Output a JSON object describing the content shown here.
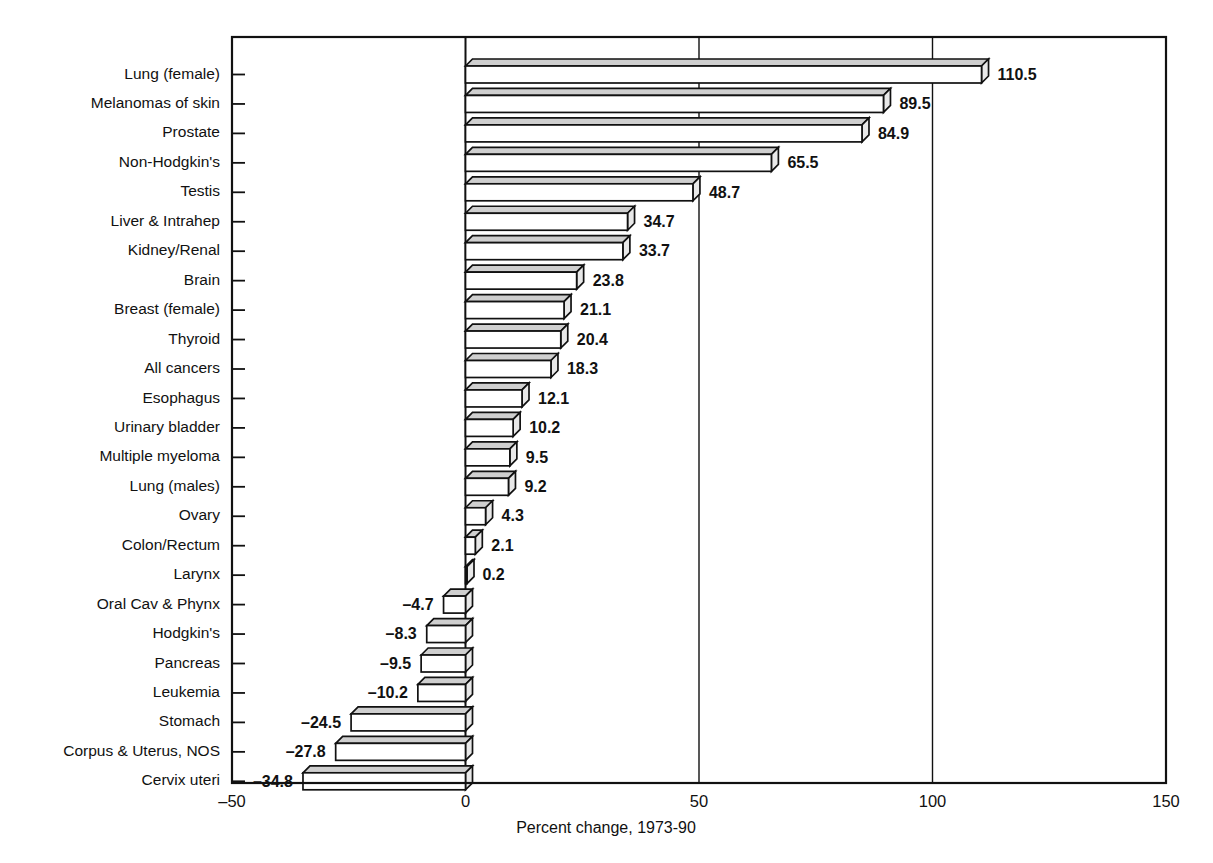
{
  "chart_data": {
    "type": "bar",
    "orientation": "horizontal",
    "title": "",
    "xlabel": "Percent change, 1973-90",
    "ylabel": "",
    "xlim": [
      -50,
      150
    ],
    "xticks": [
      -50,
      0,
      50,
      100,
      150
    ],
    "xtick_labels": [
      "–50",
      "0",
      "50",
      "100",
      "150"
    ],
    "grid": "vertical gridlines at 50 and 100; zero reference line at 0",
    "legend": "none",
    "categories": [
      "Lung (female)",
      "Melanomas of skin",
      "Prostate",
      "Non-Hodgkin's",
      "Testis",
      "Liver & Intrahep",
      "Kidney/Renal",
      "Brain",
      "Breast (female)",
      "Thyroid",
      "All cancers",
      "Esophagus",
      "Urinary bladder",
      "Multiple myeloma",
      "Lung (males)",
      "Ovary",
      "Colon/Rectum",
      "Larynx",
      "Oral Cav & Phynx",
      "Hodgkin's",
      "Pancreas",
      "Leukemia",
      "Stomach",
      "Corpus & Uterus, NOS",
      "Cervix uteri"
    ],
    "values": [
      110.5,
      89.5,
      84.9,
      65.5,
      48.7,
      34.7,
      33.7,
      23.8,
      21.1,
      20.4,
      18.3,
      12.1,
      10.2,
      9.5,
      9.2,
      4.3,
      2.1,
      0.2,
      -4.7,
      -8.3,
      -9.5,
      -10.2,
      -24.5,
      -27.8,
      -34.8
    ],
    "value_labels": [
      "110.5",
      "89.5",
      "84.9",
      "65.5",
      "48.7",
      "34.7",
      "33.7",
      "23.8",
      "21.1",
      "20.4",
      "18.3",
      "12.1",
      "10.2",
      "9.5",
      "9.2",
      "4.3",
      "2.1",
      "0.2",
      "–4.7",
      "–8.3",
      "–9.5",
      "–10.2",
      "–24.5",
      "–27.8",
      "–34.8"
    ]
  },
  "colors": {
    "bar_face": "#ffffff",
    "bar_top": "#cfcfcf",
    "outline": "#111111",
    "background": "#ffffff"
  }
}
